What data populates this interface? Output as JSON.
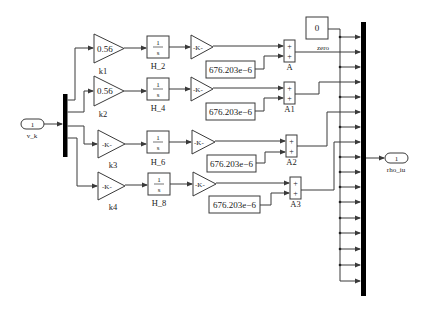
{
  "diagram": {
    "type": "simulink-block-diagram",
    "inport": {
      "number": "1",
      "name": "v_k"
    },
    "outport": {
      "number": "1",
      "name": "rho_iu"
    },
    "gains": [
      {
        "name": "k1",
        "value": "0.56"
      },
      {
        "name": "k2",
        "value": "0.56"
      },
      {
        "name": "k3",
        "value": "-K-"
      },
      {
        "name": "k4",
        "value": "-K-"
      }
    ],
    "integrators": [
      {
        "name": "H_2",
        "num": "1",
        "den": "s"
      },
      {
        "name": "H_4",
        "num": "1",
        "den": "s"
      },
      {
        "name": "H_6",
        "num": "1",
        "den": "s"
      },
      {
        "name": "H_8",
        "num": "1",
        "den": "s"
      }
    ],
    "post_gains": [
      {
        "value": "-K-"
      },
      {
        "value": "-K-"
      },
      {
        "value": "-K-"
      },
      {
        "value": "-K-"
      }
    ],
    "constants": [
      {
        "value": "676.203e−6"
      },
      {
        "value": "676.203e−6"
      },
      {
        "value": "676.203e−6"
      },
      {
        "value": "676.203e−6"
      }
    ],
    "sums": [
      {
        "name": "A",
        "signs": [
          "+",
          "+"
        ]
      },
      {
        "name": "A1",
        "signs": [
          "+",
          "+"
        ]
      },
      {
        "name": "A2",
        "signs": [
          "+",
          "+"
        ]
      },
      {
        "name": "A3",
        "signs": [
          "+",
          "+"
        ]
      }
    ],
    "zero_constant": {
      "value": "0",
      "signal_label": "zero"
    },
    "mux_inputs": 18
  }
}
